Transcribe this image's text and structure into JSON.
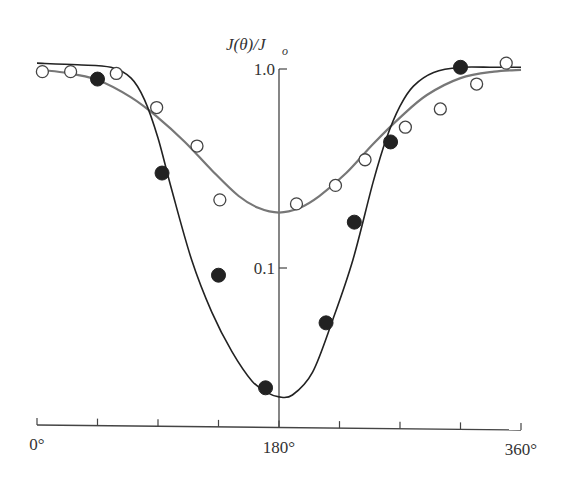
{
  "chart_data": {
    "type": "scatter",
    "title": "",
    "xlabel": "",
    "ylabel": "J(θ)/J_o",
    "ylabel_parts": {
      "main": "J(θ)/J",
      "sub": "o"
    },
    "xscale": "linear",
    "yscale": "log",
    "xlim": [
      0,
      360
    ],
    "ylim": [
      0.02,
      1.0
    ],
    "x_ticks": [
      0,
      45,
      90,
      135,
      180,
      225,
      270,
      315,
      360
    ],
    "x_tick_labels": [
      {
        "value": 0,
        "label": "0°"
      },
      {
        "value": 180,
        "label": "180°"
      },
      {
        "value": 360,
        "label": "360°"
      }
    ],
    "y_tick_labels": [
      {
        "value": 1.0,
        "label": "1.0"
      },
      {
        "value": 0.1,
        "label": "0.1"
      }
    ],
    "grid": false,
    "legend": null,
    "series": [
      {
        "name": "open-circles",
        "marker": "open-circle",
        "x": [
          4,
          25,
          59,
          89,
          119,
          136,
          193,
          222,
          244,
          274,
          300,
          327,
          349
        ],
        "y": [
          0.97,
          0.97,
          0.95,
          0.64,
          0.41,
          0.22,
          0.21,
          0.26,
          0.35,
          0.51,
          0.63,
          0.84,
          1.07
        ]
      },
      {
        "name": "filled-circles",
        "marker": "filled-circle",
        "x": [
          45,
          93,
          135,
          170,
          215,
          236,
          263,
          315
        ],
        "y": [
          0.89,
          0.3,
          0.092,
          0.025,
          0.053,
          0.17,
          0.43,
          1.02
        ]
      }
    ],
    "curves": [
      {
        "name": "fit-broad",
        "color": "#777777",
        "x": [
          0,
          20,
          45,
          70,
          90,
          110,
          130,
          150,
          165,
          180,
          195,
          210,
          230,
          250,
          270,
          290,
          315,
          340,
          360
        ],
        "y": [
          0.99,
          0.96,
          0.88,
          0.72,
          0.57,
          0.43,
          0.31,
          0.23,
          0.2,
          0.19,
          0.2,
          0.23,
          0.3,
          0.42,
          0.57,
          0.74,
          0.9,
          0.97,
          0.99
        ]
      },
      {
        "name": "fit-narrow",
        "color": "#222222",
        "x": [
          0,
          30,
          55,
          70,
          80,
          90,
          100,
          115,
          130,
          145,
          160,
          172,
          180,
          190,
          205,
          220,
          235,
          250,
          260,
          270,
          280,
          295,
          315,
          340,
          360
        ],
        "y": [
          1.07,
          1.05,
          1.02,
          0.9,
          0.7,
          0.45,
          0.25,
          0.11,
          0.06,
          0.038,
          0.027,
          0.0235,
          0.0225,
          0.023,
          0.03,
          0.055,
          0.11,
          0.27,
          0.45,
          0.65,
          0.82,
          0.96,
          1.02,
          1.02,
          1.02
        ]
      }
    ]
  }
}
